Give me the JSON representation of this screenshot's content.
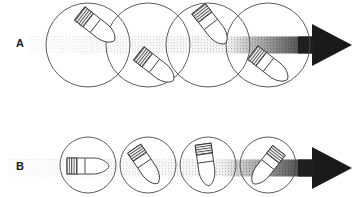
{
  "figure": {
    "background_color": "#ffffff",
    "ink_color": "#333333",
    "stipple_color": "#555555",
    "arrow_color": "#1a1a1a",
    "width": 358,
    "height": 197
  },
  "rows": [
    {
      "id": "A",
      "label": "A",
      "label_x": 16,
      "label_y": 37,
      "description": "Upper sequence: bullet tumbling with large overlapping circles",
      "band": {
        "x_start": 28,
        "x_end": 312,
        "center_y": 45,
        "thickness": 17,
        "opacity_start": 0.18,
        "opacity_end": 1.0
      },
      "arrow": {
        "tip_x": 352,
        "tail_x": 312,
        "center_y": 45,
        "head_half_height": 21,
        "head_length": 40
      },
      "circles": [
        {
          "cx": 88,
          "cy": 45,
          "r": 42
        },
        {
          "cx": 148,
          "cy": 45,
          "r": 42
        },
        {
          "cx": 208,
          "cy": 45,
          "r": 42
        },
        {
          "cx": 268,
          "cy": 45,
          "r": 42
        }
      ],
      "bullets": [
        {
          "cx": 97,
          "cy": 27,
          "angle": 38,
          "length": 44,
          "width": 17
        },
        {
          "cx": 156,
          "cy": 67,
          "angle": 38,
          "length": 44,
          "width": 17
        },
        {
          "cx": 212,
          "cy": 26,
          "angle": 52,
          "length": 44,
          "width": 17
        },
        {
          "cx": 270,
          "cy": 66,
          "angle": 38,
          "length": 44,
          "width": 17
        }
      ]
    },
    {
      "id": "B",
      "label": "B",
      "label_x": 16,
      "label_y": 160,
      "description": "Lower sequence: bullet rotating progressively with smaller tangent circles",
      "band": {
        "x_start": 8,
        "x_end": 312,
        "center_y": 168,
        "thickness": 17,
        "opacity_start": 0.18,
        "opacity_end": 1.0
      },
      "arrow": {
        "tip_x": 352,
        "tail_x": 312,
        "center_y": 168,
        "head_half_height": 21,
        "head_length": 40
      },
      "circles": [
        {
          "cx": 88,
          "cy": 165,
          "r": 28
        },
        {
          "cx": 148,
          "cy": 165,
          "r": 28
        },
        {
          "cx": 208,
          "cy": 165,
          "r": 28
        },
        {
          "cx": 268,
          "cy": 165,
          "r": 28
        }
      ],
      "bullets": [
        {
          "cx": 88,
          "cy": 166,
          "angle": 0,
          "length": 42,
          "width": 16
        },
        {
          "cx": 146,
          "cy": 166,
          "angle": 56,
          "length": 42,
          "width": 16
        },
        {
          "cx": 206,
          "cy": 165,
          "angle": 82,
          "length": 42,
          "width": 16
        },
        {
          "cx": 266,
          "cy": 167,
          "angle": 128,
          "length": 42,
          "width": 16
        }
      ]
    }
  ]
}
